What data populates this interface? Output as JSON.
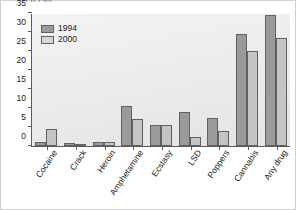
{
  "figure": {
    "clipped_title": "a g (%)",
    "background_color": "#ffffff",
    "plot_background_color": "#eeeeee",
    "axis_color": "#5a5a5a"
  },
  "legend": {
    "position": "top-left-inside",
    "entries": [
      {
        "label": "1994",
        "color": "#9a9a9a"
      },
      {
        "label": "2000",
        "color": "#d6d6d6"
      }
    ]
  },
  "chart_data": {
    "type": "bar",
    "title": "",
    "xlabel": "",
    "ylabel": "",
    "ylim": [
      0,
      35
    ],
    "yticks": [
      0,
      5,
      10,
      15,
      20,
      25,
      30,
      35
    ],
    "ytick_labels": [
      "0",
      "5",
      "10",
      "15",
      "20",
      "25",
      "30",
      "35"
    ],
    "grid": false,
    "legend_position": "upper left",
    "categories": [
      "Cocaine",
      "Crack",
      "Heroin",
      "Amphetamine",
      "Ecstasy",
      "LSD",
      "Poppers",
      "Cannabis",
      "Any drug"
    ],
    "series": [
      {
        "name": "1994",
        "color": "#9a9a9a",
        "values": [
          1.0,
          0.8,
          1.0,
          10.5,
          5.5,
          9.0,
          7.5,
          29.5,
          34.5
        ]
      },
      {
        "name": "2000",
        "color": "#c4c4c4",
        "values": [
          4.5,
          0.5,
          1.0,
          7.0,
          5.5,
          2.5,
          4.0,
          25.0,
          28.5
        ]
      }
    ]
  }
}
